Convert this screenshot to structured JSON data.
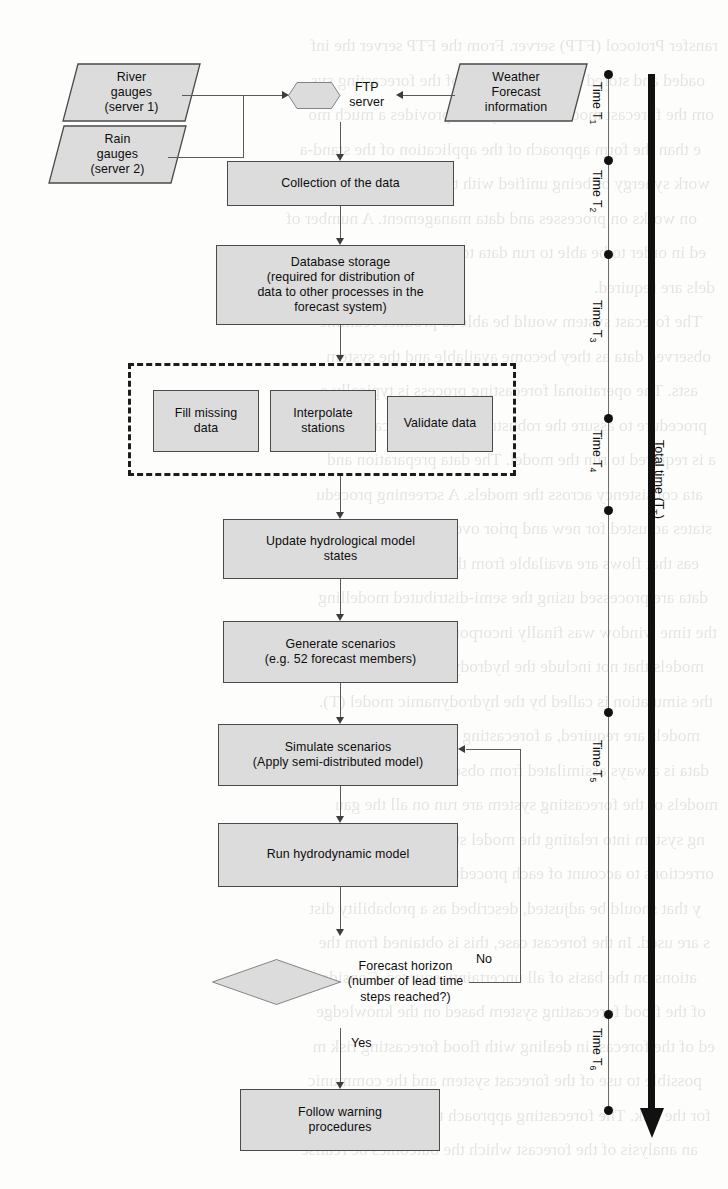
{
  "figure": {
    "type": "flowchart",
    "orientation": "top-to-bottom"
  },
  "nodes": {
    "river_gauges": "River\ngauges\n(server 1)",
    "river_gauges_l1": "River",
    "river_gauges_l2": "gauges",
    "river_gauges_l3": "(server 1)",
    "rain_gauges_l1": "Rain",
    "rain_gauges_l2": "gauges",
    "rain_gauges_l3": "(server 2)",
    "ftp_server_l1": "FTP",
    "ftp_server_l2": "server",
    "weather_l1": "Weather",
    "weather_l2": "Forecast",
    "weather_l3": "information",
    "collection": "Collection of the data",
    "database_l1": "Database storage",
    "database_l2": "(required for distribution of",
    "database_l3": "data to other processes in the",
    "database_l4": "forecast system)",
    "fill_missing_l1": "Fill missing",
    "fill_missing_l2": "data",
    "interpolate_l1": "Interpolate",
    "interpolate_l2": "stations",
    "validate": "Validate data",
    "update_states_l1": "Update hydrological model",
    "update_states_l2": "states",
    "generate_l1": "Generate scenarios",
    "generate_l2": "(e.g. 52 forecast members)",
    "simulate_l1": "Simulate scenarios",
    "simulate_l2": "(Apply semi-distributed model)",
    "hydrodynamic": "Run hydrodynamic model",
    "decision_l1": "Forecast horizon",
    "decision_l2": "(number of lead time",
    "decision_l3": "steps reached?)",
    "follow_warning_l1": "Follow warning",
    "follow_warning_l2": "procedures"
  },
  "edge_labels": {
    "no": "No",
    "yes": "Yes"
  },
  "time_axis": {
    "total_label": "Total time (T",
    "total_sub": "T",
    "total_close": ")",
    "segments": [
      {
        "name": "Time T",
        "sub": "1"
      },
      {
        "name": "Time T",
        "sub": "2"
      },
      {
        "name": "Time T",
        "sub": "3"
      },
      {
        "name": "Time T",
        "sub": "4"
      },
      {
        "name": "Time T",
        "sub": "5"
      },
      {
        "name": "Time T",
        "sub": "6"
      }
    ]
  },
  "colors": {
    "node_fill": "#dcdcdc",
    "node_border": "#4a4a4a",
    "connector": "#5a5a5a",
    "axis_dark": "#111111",
    "page_background": "#fdfdfb"
  },
  "ghost_text": {
    "lines": [
      "ransfer Protocol (FTP) server. From the FTP server the inf",
      "oaded and stored into the database of the forecasting sys",
      "om the forecast models. Usually, this provides a much mo",
      "e than the form approach of the application of the stand-a",
      "work synergy of being unified with the  forecast system.",
      "on works on processes and data management. A number of",
      "ed in order to be able to run data to interpolate required onto mod",
      "dels are required.",
      "The forecast system would be able to produce  realtime",
      "observed data as they become available and the system",
      "asts. The operational forecasting process is typically a",
      "procedure to assure the robustness of the forecasting sys",
      "a is required to run the model. The data preparation and",
      "ata consistency across the models. A screening procedu",
      "states adjusted for new and prior over the most recent pe",
      "eas that flows are available from the most recent flow dat",
      "data are processed using the semi-distributed modelling",
      "the time window was finally incorporated. The simulatio",
      "models that not include the hydrodynamic or wave-sur",
      "the simulation is called by the hydrodynamic model (T).",
      "models are required, a forecasting follows a procedure to",
      "data is always assimilated from observations.",
      "models of the forecasting system are run on all the  gau",
      "ng system into relating the model states as a further proc",
      "orrections to account of each procedure is the model stat",
      "y that should be adjusted, described as a probability dist",
      "s are used. In the forecast case, this is obtained from the",
      "ations on the basis of all uncertainty sources. Considera",
      "of the flood forecasting system based on the knowledge",
      "ed of the forecast in dealing with flood forecasting risk m",
      "possible to use of the forecast system and the communic",
      "for the risk. The forecasting approach then allows  it to bel",
      "an analysis of the forecast which the outcomes be realise"
    ]
  }
}
